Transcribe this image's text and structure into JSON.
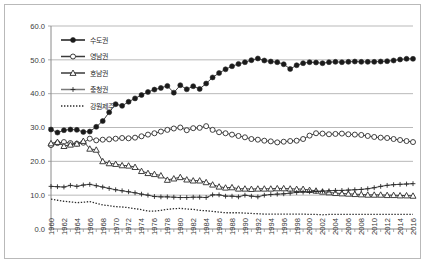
{
  "chart_data": {
    "type": "line",
    "title": "",
    "xlabel": "",
    "ylabel": "",
    "ylim": [
      0.0,
      60.0
    ],
    "ytick_labels": [
      "0.0",
      "10.0",
      "20.0",
      "30.0",
      "40.0",
      "50.0",
      "60.0"
    ],
    "ytick_values": [
      0,
      10,
      20,
      30,
      40,
      50,
      60
    ],
    "grid": "horizontal",
    "legend_position": "upper-left",
    "xlim": [
      1960,
      2016
    ],
    "x_tick_step": 2,
    "x": [
      1960,
      1961,
      1962,
      1963,
      1964,
      1965,
      1966,
      1967,
      1968,
      1969,
      1970,
      1971,
      1972,
      1973,
      1974,
      1975,
      1976,
      1977,
      1978,
      1979,
      1980,
      1981,
      1982,
      1983,
      1984,
      1985,
      1986,
      1987,
      1988,
      1989,
      1990,
      1991,
      1992,
      1993,
      1994,
      1995,
      1996,
      1997,
      1998,
      1999,
      2000,
      2001,
      2002,
      2003,
      2004,
      2005,
      2006,
      2007,
      2008,
      2009,
      2010,
      2011,
      2012,
      2013,
      2014,
      2015,
      2016
    ],
    "xtick_labels": [
      "1960",
      "1962",
      "1964",
      "1966",
      "1968",
      "1970",
      "1972",
      "1974",
      "1976",
      "1978",
      "1980",
      "1982",
      "1984",
      "1986",
      "1988",
      "1990",
      "1992",
      "1994",
      "1996",
      "1998",
      "2000",
      "2002",
      "2004",
      "2006",
      "2008",
      "2010",
      "2012",
      "2014",
      "2016"
    ],
    "series": [
      {
        "name": "수도권",
        "marker": "filled-circle",
        "line_style": "solid",
        "color": "#1a1a1a",
        "values": [
          29.4,
          28.5,
          29.2,
          29.4,
          29.3,
          28.7,
          28.8,
          30.2,
          31.9,
          34.5,
          36.9,
          36.4,
          37.6,
          38.6,
          39.6,
          40.5,
          41.2,
          41.7,
          42.3,
          40.3,
          42.5,
          41.3,
          42.2,
          41.4,
          43.0,
          44.8,
          46.1,
          47.2,
          48.1,
          48.8,
          49.3,
          49.9,
          50.4,
          49.8,
          49.5,
          49.3,
          48.7,
          47.3,
          48.4,
          49.0,
          49.3,
          49.2,
          49.0,
          49.3,
          49.4,
          49.3,
          49.4,
          49.5,
          49.4,
          49.4,
          49.4,
          49.5,
          49.6,
          49.8,
          50.1,
          50.3,
          50.3
        ]
      },
      {
        "name": "영남권",
        "marker": "open-circle",
        "line_style": "solid",
        "color": "#3a3a3a",
        "values": [
          24.8,
          25.4,
          25.7,
          25.4,
          25.2,
          25.5,
          26.7,
          26.2,
          26.4,
          26.5,
          26.7,
          26.9,
          26.8,
          27.0,
          27.4,
          27.9,
          28.3,
          28.8,
          29.3,
          29.7,
          30.0,
          29.2,
          29.8,
          29.9,
          30.4,
          29.3,
          28.6,
          28.3,
          27.9,
          27.5,
          27.1,
          26.6,
          26.4,
          26.1,
          25.9,
          25.6,
          25.8,
          26.0,
          26.1,
          26.6,
          27.6,
          28.3,
          28.2,
          28.0,
          28.1,
          28.2,
          28.0,
          27.9,
          27.8,
          27.5,
          27.2,
          27.0,
          26.9,
          26.6,
          26.3,
          26.0,
          25.7
        ]
      },
      {
        "name": "호남권",
        "marker": "open-triangle",
        "line_style": "solid",
        "color": "#3a3a3a",
        "values": [
          25.3,
          25.7,
          24.5,
          24.9,
          25.2,
          26.0,
          23.7,
          23.4,
          20.0,
          19.4,
          19.2,
          18.8,
          18.7,
          18.3,
          17.1,
          16.5,
          16.2,
          15.8,
          14.5,
          14.9,
          15.3,
          14.6,
          14.3,
          14.3,
          13.8,
          13.1,
          12.5,
          12.2,
          12.3,
          11.9,
          11.9,
          11.8,
          11.9,
          11.9,
          11.9,
          12.0,
          12.0,
          11.9,
          11.8,
          11.8,
          11.5,
          11.3,
          11.0,
          10.8,
          10.6,
          10.5,
          10.4,
          10.3,
          10.2,
          10.1,
          10.1,
          10.1,
          10.0,
          10.0,
          9.9,
          9.9,
          9.8
        ]
      },
      {
        "name": "충청권",
        "marker": "plus",
        "line_style": "solid",
        "color": "#7a7a7a",
        "values": [
          12.6,
          12.5,
          12.4,
          12.9,
          12.6,
          13.0,
          13.2,
          12.8,
          12.4,
          12.0,
          11.6,
          11.3,
          11.0,
          10.7,
          10.3,
          10.0,
          9.6,
          9.5,
          9.5,
          9.4,
          9.3,
          9.3,
          9.4,
          9.4,
          9.3,
          10.1,
          10.1,
          9.7,
          9.7,
          9.5,
          10.0,
          9.7,
          9.5,
          10.0,
          10.2,
          10.3,
          10.4,
          10.6,
          10.8,
          10.9,
          11.0,
          11.1,
          11.2,
          11.3,
          11.4,
          11.4,
          11.5,
          11.6,
          11.7,
          11.9,
          12.2,
          12.6,
          12.9,
          13.1,
          13.2,
          13.3,
          13.4
        ]
      },
      {
        "name": "강원제주",
        "marker": "none",
        "line_style": "dotted",
        "color": "#2b2b2b",
        "values": [
          8.8,
          8.5,
          8.2,
          8.0,
          7.8,
          7.9,
          8.1,
          7.6,
          7.1,
          6.9,
          6.6,
          6.5,
          6.3,
          6.0,
          5.7,
          5.3,
          5.3,
          5.5,
          5.8,
          6.0,
          6.1,
          5.9,
          5.8,
          5.5,
          5.4,
          5.2,
          5.0,
          4.8,
          4.8,
          4.8,
          4.7,
          4.6,
          4.5,
          4.4,
          4.4,
          4.4,
          4.4,
          4.4,
          4.4,
          4.4,
          4.3,
          4.3,
          4.2,
          4.3,
          4.3,
          4.3,
          4.3,
          4.3,
          4.3,
          4.3,
          4.3,
          4.3,
          4.3,
          4.3,
          4.3,
          4.3,
          4.3
        ]
      }
    ]
  }
}
